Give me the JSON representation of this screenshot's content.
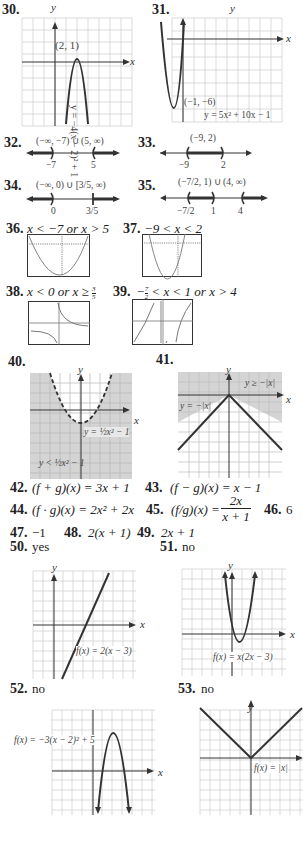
{
  "problems": {
    "p30": {
      "number": "30.",
      "point_label": "(2, 1)",
      "equation": "y = −4(x − 2)² + 1",
      "x_axis": "x",
      "y_axis": "y"
    },
    "p31": {
      "number": "31.",
      "point_label": "(−1, −6)",
      "equation": "y = 5x² + 10x − 1",
      "x_axis": "x",
      "y_axis": "y"
    },
    "p32": {
      "number": "32.",
      "interval": "(−∞, −7) ∪ (5, ∞)",
      "ticks": [
        "−7",
        "5"
      ]
    },
    "p33": {
      "number": "33.",
      "interval": "(−9, 2)",
      "ticks": [
        "−9",
        "2"
      ]
    },
    "p34": {
      "number": "34.",
      "interval": "(−∞, 0) ∪ [3/5, ∞)",
      "ticks": [
        "0",
        "3/5"
      ]
    },
    "p35": {
      "number": "35.",
      "interval": "(−7/2, 1) ∪ (4, ∞)",
      "ticks": [
        "−7/2",
        "1",
        "4"
      ]
    },
    "p36": {
      "number": "36.",
      "answer": "x < −7 or x > 5"
    },
    "p37": {
      "number": "37.",
      "answer": "−9 < x < 2"
    },
    "p38": {
      "number": "38.",
      "answer_prefix": "x < 0 or x ≥",
      "frac_num": "3",
      "frac_den": "5"
    },
    "p39": {
      "number": "39.",
      "answer_prefix": "−",
      "frac_num": "7",
      "frac_den": "2",
      "answer_suffix": "< x < 1 or x > 4"
    },
    "p40": {
      "number": "40.",
      "boundary_label": "y = ½x² − 1",
      "region_label": "y < ½x² − 1",
      "x_axis": "x",
      "y_axis": "y"
    },
    "p41": {
      "number": "41.",
      "region_label": "y ≥ −|x|",
      "boundary_label": "y = −|x|",
      "x_axis": "x",
      "y_axis": "y"
    },
    "p42": {
      "number": "42.",
      "answer": "(f + g)(x) = 3x + 1"
    },
    "p43": {
      "number": "43.",
      "answer": "(f − g)(x) = x − 1"
    },
    "p44": {
      "number": "44.",
      "answer": "(f · g)(x) = 2x² + 2x"
    },
    "p45": {
      "number": "45.",
      "answer_prefix": "(f/g)(x) =",
      "frac_num": "2x",
      "frac_den": "x + 1"
    },
    "p46": {
      "number": "46.",
      "answer": "6"
    },
    "p47": {
      "number": "47.",
      "answer": "−1"
    },
    "p48": {
      "number": "48.",
      "answer": "2(x + 1)"
    },
    "p49": {
      "number": "49.",
      "answer": "2x + 1"
    },
    "p50": {
      "number": "50.",
      "answer": "yes",
      "graph_label": "f(x) = 2(x − 3)",
      "x_axis": "x",
      "y_axis": "y"
    },
    "p51": {
      "number": "51.",
      "answer": "no",
      "graph_label": "f(x) = x(2x − 3)",
      "x_axis": "x",
      "y_axis": "y"
    },
    "p52": {
      "number": "52.",
      "answer": "no",
      "graph_label": "f(x) = −3(x − 2)² + 5",
      "x_axis": "x",
      "y_axis": "y"
    },
    "p53": {
      "number": "53.",
      "answer": "no",
      "graph_label": "f(x) = |x|",
      "y_axis": "y"
    }
  },
  "colors": {
    "curve": "#333333",
    "grid": "#cccccc",
    "shade": "#d4d4d4",
    "text": "#222222"
  }
}
